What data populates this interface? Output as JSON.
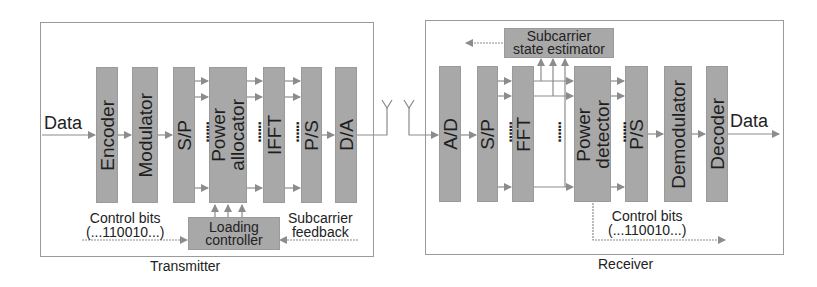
{
  "transmitter": {
    "caption": "Transmitter",
    "input_label": "Data",
    "blocks": [
      {
        "id": "encoder",
        "label": "Encoder"
      },
      {
        "id": "modulator",
        "label": "Modulator"
      },
      {
        "id": "sp",
        "label": "S/P"
      },
      {
        "id": "power-allocator",
        "label": "Power\nallocator"
      },
      {
        "id": "ifft",
        "label": "IFFT"
      },
      {
        "id": "ps",
        "label": "P/S"
      },
      {
        "id": "da",
        "label": "D/A"
      }
    ],
    "loading_controller": "Loading\ncontroller",
    "control_bits": "Control bits\n(...110010...)",
    "subcarrier_feedback": "Subcarrier\nfeedback",
    "dots": "......"
  },
  "receiver": {
    "caption": "Receiver",
    "output_label": "Data",
    "blocks": [
      {
        "id": "ad",
        "label": "A/D"
      },
      {
        "id": "sp",
        "label": "S/P"
      },
      {
        "id": "fft",
        "label": "FFT"
      },
      {
        "id": "power-detector",
        "label": "Power\ndetector"
      },
      {
        "id": "ps",
        "label": "P/S"
      },
      {
        "id": "demodulator",
        "label": "Demodulator"
      },
      {
        "id": "decoder",
        "label": "Decoder"
      }
    ],
    "state_estimator": "Subcarrier\nstate estimator",
    "control_bits": "Control bits\n(...110010...)",
    "dots": "......"
  },
  "colors": {
    "block_fill": "#a8a8a8",
    "line": "#8c8c8c",
    "frame": "#9a9a9a",
    "text": "#222222"
  }
}
